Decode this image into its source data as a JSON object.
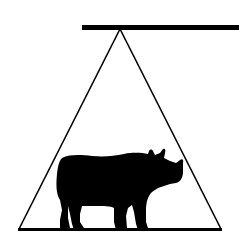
{
  "figure": {
    "colors": {
      "background": "#ffffff",
      "ink": "#000000"
    },
    "shapes": {
      "top_bar": "horizontal-bar",
      "triangle": "triangle-outline",
      "base_line": "base-line",
      "animal": "rhinoceros-silhouette"
    }
  }
}
